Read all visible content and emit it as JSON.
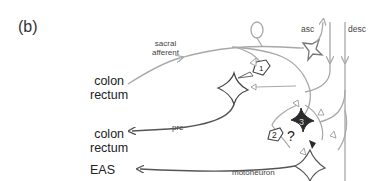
{
  "panel_label": "(b)",
  "targets": {
    "colon_rectum_top": [
      "colon",
      "rectum"
    ],
    "colon_rectum_bottom": [
      "colon",
      "rectum"
    ],
    "eas": "EAS"
  },
  "pathway_labels": {
    "sacral_afferent": [
      "sacral",
      "afferent"
    ],
    "pre": "pre",
    "motoneuron": "motoneuron",
    "asc": "asc",
    "desc": "desc"
  },
  "neurons": [
    {
      "id": "1",
      "label": "1",
      "style": "outline"
    },
    {
      "id": "2",
      "label": "2",
      "style": "outline"
    },
    {
      "id": "3",
      "label": "3",
      "style": "filled"
    }
  ],
  "unknown_marker": "?",
  "colors": {
    "line_light": "#a8a8a8",
    "line_dark": "#555555",
    "neuron_fill_dark": "#2b2b2b",
    "text": "#222222"
  }
}
